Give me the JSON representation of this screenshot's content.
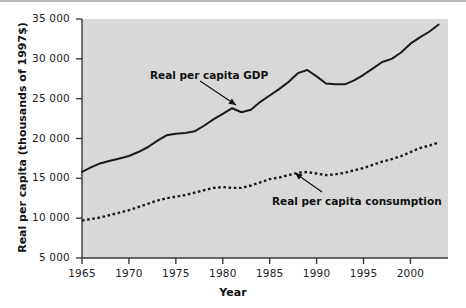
{
  "chart_data": {
    "type": "line",
    "title": "",
    "xlabel": "Year",
    "ylabel": "Real per capita (thousands of 1997$)",
    "xlim": [
      1965,
      2004
    ],
    "ylim": [
      5000,
      35000
    ],
    "xticks": [
      "1965",
      "1970",
      "1975",
      "1980",
      "1985",
      "1990",
      "1995",
      "2000"
    ],
    "xtick_values": [
      1965,
      1970,
      1975,
      1980,
      1985,
      1990,
      1995,
      2000
    ],
    "yticks": [
      "5 000",
      "10 000",
      "15 000",
      "20 000",
      "25 000",
      "30 000",
      "35 000"
    ],
    "ytick_values": [
      5000,
      10000,
      15000,
      20000,
      25000,
      30000,
      35000
    ],
    "grid": false,
    "legend_position": "inline-annotations",
    "plot_background": "#d8d8d8",
    "axis_color": "#3a3a3a",
    "series": [
      {
        "name": "Real per capita GDP",
        "style": "solid",
        "color": "#1a1a1a",
        "x": [
          1965,
          1966,
          1967,
          1968,
          1969,
          1970,
          1971,
          1972,
          1973,
          1974,
          1975,
          1976,
          1977,
          1978,
          1979,
          1980,
          1981,
          1982,
          1983,
          1984,
          1985,
          1986,
          1987,
          1988,
          1989,
          1990,
          1991,
          1992,
          1993,
          1994,
          1995,
          1996,
          1997,
          1998,
          1999,
          2000,
          2001,
          2002,
          2003
        ],
        "values": [
          15800,
          16400,
          16900,
          17200,
          17500,
          17800,
          18300,
          18900,
          19700,
          20400,
          20600,
          20700,
          20900,
          21600,
          22400,
          23100,
          23800,
          23300,
          23600,
          24600,
          25400,
          26200,
          27100,
          28200,
          28600,
          27800,
          26900,
          26800,
          26800,
          27300,
          28000,
          28800,
          29600,
          30000,
          30800,
          31900,
          32700,
          33400,
          34300
        ]
      },
      {
        "name": "Real per capita consumption",
        "style": "dotted",
        "color": "#1a1a1a",
        "x": [
          1965,
          1966,
          1967,
          1968,
          1969,
          1970,
          1971,
          1972,
          1973,
          1974,
          1975,
          1976,
          1977,
          1978,
          1979,
          1980,
          1981,
          1982,
          1983,
          1984,
          1985,
          1986,
          1987,
          1988,
          1989,
          1990,
          1991,
          1992,
          1993,
          1994,
          1995,
          1996,
          1997,
          1998,
          1999,
          2000,
          2001,
          2002,
          2003
        ],
        "values": [
          9700,
          9900,
          10100,
          10400,
          10700,
          11000,
          11400,
          11800,
          12200,
          12500,
          12700,
          12900,
          13200,
          13500,
          13800,
          13900,
          13800,
          13800,
          14100,
          14500,
          14900,
          15100,
          15400,
          15700,
          15800,
          15600,
          15400,
          15500,
          15700,
          16000,
          16300,
          16700,
          17100,
          17400,
          17800,
          18300,
          18800,
          19100,
          19500
        ]
      }
    ],
    "annotations": [
      {
        "text": "Real per capita GDP",
        "text_x": 150,
        "text_y": 69,
        "arrow_from_x": 200,
        "arrow_from_y": 81,
        "arrow_to_x": 236,
        "arrow_to_y": 105
      },
      {
        "text": "Real per capita consumption",
        "text_x": 272,
        "text_y": 195,
        "arrow_from_x": 322,
        "arrow_from_y": 192,
        "arrow_to_x": 295,
        "arrow_to_y": 173
      }
    ]
  }
}
